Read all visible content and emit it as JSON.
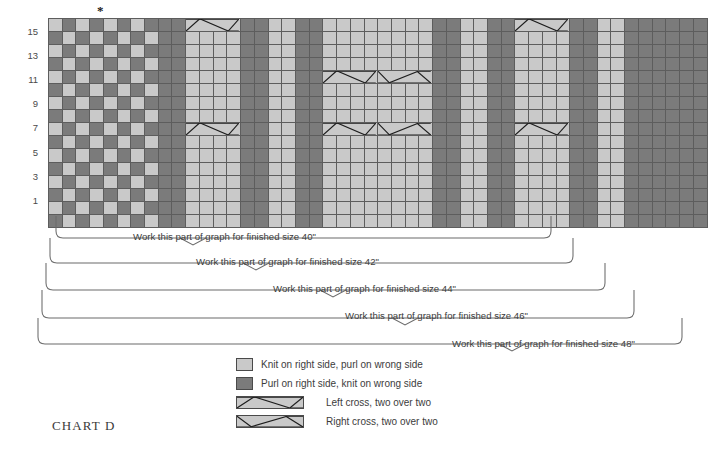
{
  "chart_title": "CHART D",
  "asterisk_marker": "*",
  "row_numbers_left": [
    "15",
    "13",
    "11",
    "9",
    "7",
    "5",
    "3",
    "1"
  ],
  "row_numbers_right": [
    "16",
    "14",
    "12",
    "10",
    "8",
    "6",
    "4",
    "2"
  ],
  "grid": {
    "columns": 48,
    "rows": 16,
    "colors": {
      "light": "#c9c9c9",
      "dark": "#7b7b7b",
      "gridline": "#5d5d5d",
      "sizebar": "#1d1d1d"
    },
    "column_types": [
      "dark",
      "light",
      "dark",
      "light",
      "dark",
      "light",
      "dark",
      "light",
      "dark",
      "dark",
      "light",
      "light",
      "light",
      "light",
      "dark",
      "dark",
      "light",
      "light",
      "dark",
      "dark",
      "light",
      "light",
      "light",
      "light",
      "light",
      "light",
      "light",
      "light",
      "dark",
      "dark",
      "light",
      "light",
      "dark",
      "dark",
      "light",
      "light",
      "light",
      "light",
      "dark",
      "dark",
      "light",
      "light",
      "dark",
      "dark",
      "dark",
      "dark",
      "dark",
      "dark"
    ],
    "checker_columns_end": 10,
    "size_boundary_after_columns": [
      38,
      40,
      42,
      44,
      48
    ],
    "cable_blocks": [
      {
        "start_col": 11,
        "end_col": 14,
        "row": 16,
        "type": "left-cross"
      },
      {
        "start_col": 11,
        "end_col": 14,
        "row": 8,
        "type": "left-cross"
      },
      {
        "start_col": 21,
        "end_col": 24,
        "row": 12,
        "type": "left-cross"
      },
      {
        "start_col": 25,
        "end_col": 28,
        "row": 12,
        "type": "right-cross"
      },
      {
        "start_col": 21,
        "end_col": 24,
        "row": 8,
        "type": "left-cross"
      },
      {
        "start_col": 25,
        "end_col": 28,
        "row": 8,
        "type": "right-cross"
      },
      {
        "start_col": 35,
        "end_col": 38,
        "row": 16,
        "type": "left-cross"
      },
      {
        "start_col": 35,
        "end_col": 38,
        "row": 8,
        "type": "left-cross"
      }
    ]
  },
  "brackets": [
    {
      "label": "Work this part of graph for finished size 40\"",
      "size": "40\""
    },
    {
      "label": "Work this part of graph for finished size 42\"",
      "size": "42\""
    },
    {
      "label": "Work this part of graph for finished size 44\"",
      "size": "44\""
    },
    {
      "label": "Work this part of graph for finished size 46\"",
      "size": "46\""
    },
    {
      "label": "Work this part of graph for finished size 48\"",
      "size": "48\""
    }
  ],
  "legend": [
    {
      "swatch": "light",
      "text": "Knit on right side, purl on wrong side"
    },
    {
      "swatch": "dark",
      "text": "Purl on right side, knit on wrong side"
    },
    {
      "swatch": "left-cross",
      "text": "Left cross, two over two"
    },
    {
      "swatch": "right-cross",
      "text": "Right cross, two over two"
    }
  ]
}
